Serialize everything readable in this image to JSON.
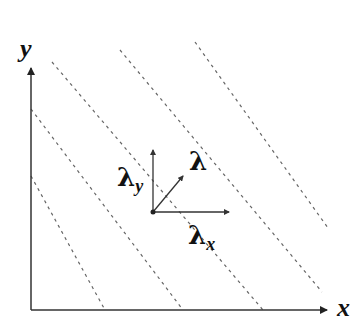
{
  "diagram": {
    "axes": {
      "x_label": "x",
      "y_label": "y"
    },
    "vectors": {
      "lambda": "λ",
      "lambda_x_base": "λ",
      "lambda_x_sub": "x",
      "lambda_y_base": "λ",
      "lambda_y_sub": "y"
    },
    "colors": {
      "axis": "#333333",
      "dashed_lines": "#666666",
      "text": "#111111"
    }
  }
}
